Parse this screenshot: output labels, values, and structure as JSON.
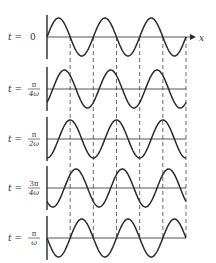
{
  "figure": {
    "type": "traveling-wave snapshots",
    "x_axis_label": "x",
    "colors": {
      "ink": "#2a2a2a",
      "background": "#ffffff"
    },
    "panels": [
      {
        "label_prefix": "t =",
        "label_num": "0",
        "label_den": "",
        "phase": 0
      },
      {
        "label_prefix": "t =",
        "label_num": "π",
        "label_den": "4ω",
        "phase": 0.7854
      },
      {
        "label_prefix": "t =",
        "label_num": "π",
        "label_den": "2ω",
        "phase": 1.5708
      },
      {
        "label_prefix": "t =",
        "label_num": "3π",
        "label_den": "4ω",
        "phase": 2.3562
      },
      {
        "label_prefix": "t =",
        "label_num": "π",
        "label_den": "ω",
        "phase": 3.1416
      }
    ],
    "periods_shown": 3
  }
}
